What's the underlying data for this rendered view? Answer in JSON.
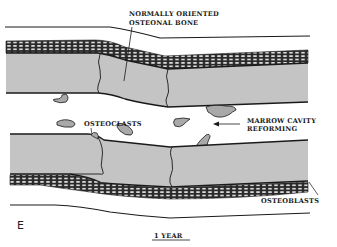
{
  "figure": {
    "panel_letter": "E",
    "caption": "1 YEAR",
    "labels": {
      "osteonal_line1": "NORMALLY ORIENTED",
      "osteonal_line2": "OSTEONAL BONE",
      "osteoclasts": "OSTEOCLASTS",
      "marrow_line1": "MARROW CAVITY",
      "marrow_line2": "REFORMING",
      "osteoblasts": "OSTEOBLASTS"
    },
    "colors": {
      "bone": "#c4c4c4",
      "ink": "#1a1a1a",
      "background": "#ffffff",
      "osteoclast_fill": "#a9a9a9"
    }
  }
}
